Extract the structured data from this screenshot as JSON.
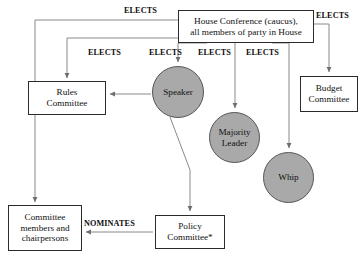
{
  "diagram": {
    "title_fragment": "",
    "background": "#ffffff",
    "circle_fill": "#a9a9a9",
    "box_stroke": "#2b2b2b",
    "line_color": "#7a7a7a",
    "nodes": {
      "house_conference": {
        "line1": "House Conference (caucus),",
        "line2": "all members of party in House"
      },
      "rules_committee": {
        "line1": "Rules",
        "line2": "Committee"
      },
      "budget_committee": {
        "line1": "Budget",
        "line2": "Committee"
      },
      "committee_members": {
        "line1": "Committee",
        "line2": "members and",
        "line3": "chairpersons"
      },
      "policy_committee": {
        "line1": "Policy",
        "line2": "Committee*"
      },
      "speaker": {
        "label": "Speaker"
      },
      "majority_leader": {
        "line1": "Majority",
        "line2": "Leader"
      },
      "whip": {
        "label": "Whip"
      }
    },
    "edge_labels": {
      "elects_committee_members": "ELECTS",
      "elects_rules": "ELECTS",
      "elects_speaker": "ELECTS",
      "elects_majority": "ELECTS",
      "elects_whip": "ELECTS",
      "elects_budget": "ELECTS",
      "nominates": "NOMINATES"
    }
  }
}
